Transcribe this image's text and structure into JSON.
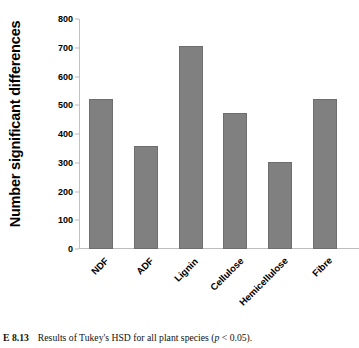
{
  "chart_data": {
    "type": "bar",
    "title": "",
    "xlabel": "",
    "ylabel": "Number significant differences",
    "categories": [
      "NDF",
      "ADF",
      "Lignin",
      "Cellulose",
      "Hemicellulose",
      "Fibre"
    ],
    "values": [
      523,
      360,
      705,
      473,
      302,
      523
    ],
    "ylim": [
      0,
      800
    ],
    "ytick_labels": [
      "800",
      "700",
      "600",
      "500",
      "400",
      "300",
      "200",
      "100",
      "0"
    ],
    "ytick_values": [
      800,
      700,
      600,
      500,
      400,
      300,
      200,
      100,
      0
    ],
    "ytick_step": 100,
    "grid": false,
    "legend": false,
    "legend_position": "none",
    "bar_color": "#808080",
    "bar_border_color": "#6e6e6e",
    "axis_color": "#bdbdbd",
    "background_color": "#ffffff"
  },
  "caption": {
    "number": "E 8.13",
    "text_before": "Results of Tukey's HSD for all plant species (",
    "italic_symbol": "p",
    "text_after": " < 0.05)."
  }
}
